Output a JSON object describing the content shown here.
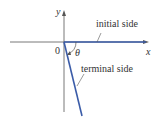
{
  "diagram": {
    "axes": {
      "x_label": "x",
      "y_label": "y",
      "origin_label": "0"
    },
    "angle_label": "θ",
    "initial_side_label": "initial side",
    "terminal_side_label": "terminal side",
    "colors": {
      "axis": "#555555",
      "ray": "#3b5ca8",
      "text": "#333333"
    }
  }
}
